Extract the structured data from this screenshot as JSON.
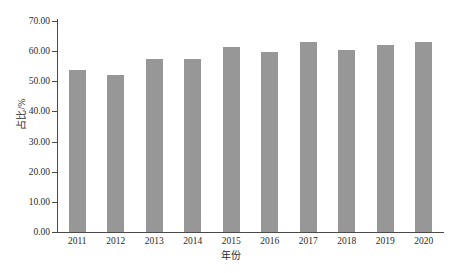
{
  "chart_data": {
    "type": "bar",
    "title": "",
    "subtitle": "",
    "xlabel": "年份",
    "ylabel": "占比/%",
    "categories": [
      "2011",
      "2012",
      "2013",
      "2014",
      "2015",
      "2016",
      "2017",
      "2018",
      "2019",
      "2020"
    ],
    "values": [
      53.6,
      52.2,
      57.4,
      57.5,
      61.3,
      59.6,
      63.1,
      60.3,
      62.2,
      63.0
    ],
    "series": [
      {
        "name": "占比/%",
        "values": [
          53.6,
          52.2,
          57.4,
          57.5,
          61.3,
          59.6,
          63.1,
          60.3,
          62.2,
          63.0
        ]
      }
    ],
    "ylim": [
      0,
      70
    ],
    "y_ticks": [
      0,
      10,
      20,
      30,
      40,
      50,
      60,
      70
    ],
    "y_tick_labels": [
      "0.00",
      "10.00",
      "20.00",
      "30.00",
      "40.00",
      "50.00",
      "60.00",
      "70.00"
    ],
    "grid": false,
    "legend": "none",
    "bar_color": "#979797",
    "axis_color": "#4a4a4a",
    "background_color": "#ffffff",
    "text_color": "#2b2b2b"
  }
}
